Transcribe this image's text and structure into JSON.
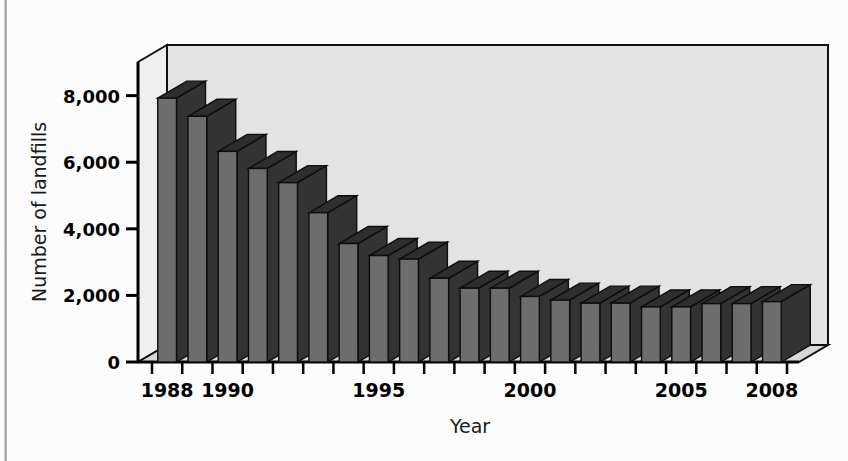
{
  "figure": {
    "background_color": "#fcfcfc",
    "plot_wall_color": "#e3e3e3",
    "plot_floor_color": "#d8d8d8",
    "bar_front_color": "#6d6d6d",
    "bar_side_color": "#333333",
    "bar_top_color": "#2e2e2e",
    "axis_color": "#000000"
  },
  "chart_data": {
    "type": "bar",
    "title": "",
    "xlabel": "Year",
    "ylabel": "Number of landfills",
    "ylim": [
      0,
      8800
    ],
    "yticks": [
      0,
      2000,
      4000,
      6000,
      8000
    ],
    "ytick_labels": [
      "0",
      "2,000",
      "4,000",
      "6,000",
      "8,000"
    ],
    "grid": false,
    "legend": false,
    "three_d": true,
    "categories": [
      "1988",
      "1989",
      "1990",
      "1991",
      "1992",
      "1993",
      "1994",
      "1995",
      "1996",
      "1997",
      "1998",
      "1999",
      "2000",
      "2001",
      "2002",
      "2003",
      "2004",
      "2005",
      "2006",
      "2007",
      "2008"
    ],
    "xtick_labels_shown": [
      "1988",
      "1990",
      "1995",
      "2000",
      "2005",
      "2008"
    ],
    "values": [
      7924,
      7379,
      6326,
      5812,
      5386,
      4482,
      3558,
      3197,
      3091,
      2514,
      2216,
      2216,
      1967,
      1858,
      1767,
      1767,
      1654,
      1654,
      1754,
      1754,
      1812
    ]
  },
  "axis": {
    "y_title": "Number of landfills",
    "x_title": "Year"
  }
}
